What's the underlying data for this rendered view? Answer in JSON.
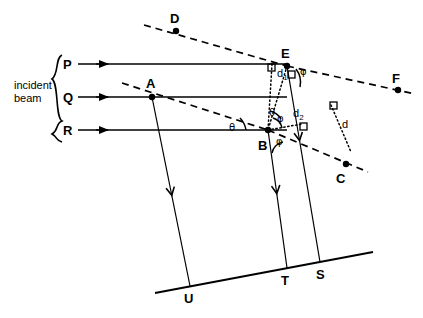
{
  "figure": {
    "background_color": "#ffffff",
    "stroke_color": "#000000",
    "width": 423,
    "height": 318
  },
  "annotations": {
    "incident_beam_line1": "incident",
    "incident_beam_line2": "beam",
    "brace_glyph": "}"
  },
  "points": [
    {
      "id": "P",
      "label": "P",
      "x": 72,
      "y": 64,
      "label_x": 63,
      "label_y": 69,
      "dot": false
    },
    {
      "id": "Q",
      "label": "Q",
      "x": 72,
      "y": 97,
      "label_x": 63,
      "label_y": 102,
      "dot": false
    },
    {
      "id": "R",
      "label": "R",
      "x": 72,
      "y": 130,
      "label_x": 63,
      "label_y": 135,
      "dot": false
    },
    {
      "id": "A",
      "label": "A",
      "x": 152,
      "y": 97,
      "label_x": 146,
      "label_y": 88,
      "dot": true
    },
    {
      "id": "B",
      "label": "B",
      "x": 268,
      "y": 130,
      "label_x": 258,
      "label_y": 150,
      "dot": true
    },
    {
      "id": "E",
      "label": "E",
      "x": 287,
      "y": 66,
      "label_x": 281,
      "label_y": 58,
      "dot": true
    },
    {
      "id": "D",
      "label": "D",
      "x": 176,
      "y": 31,
      "label_x": 170,
      "label_y": 23,
      "dot": true
    },
    {
      "id": "F",
      "label": "F",
      "x": 398,
      "y": 90,
      "label_x": 392,
      "label_y": 83,
      "dot": true
    },
    {
      "id": "C",
      "label": "C",
      "x": 346,
      "y": 164,
      "label_x": 336,
      "label_y": 183,
      "dot": true
    },
    {
      "id": "U",
      "label": "U",
      "x": 190,
      "y": 286,
      "label_x": 184,
      "label_y": 303,
      "dot": false
    },
    {
      "id": "T",
      "label": "T",
      "x": 287,
      "y": 268,
      "label_x": 281,
      "label_y": 285,
      "dot": false
    },
    {
      "id": "S",
      "label": "S",
      "x": 320,
      "y": 262,
      "label_x": 316,
      "label_y": 279,
      "dot": false
    }
  ],
  "distance_labels": [
    {
      "id": "d1",
      "base": "d",
      "sub": "1",
      "x": 277,
      "y": 77
    },
    {
      "id": "d2",
      "base": "d",
      "sub": "2",
      "x": 293,
      "y": 117
    },
    {
      "id": "d",
      "base": "d",
      "sub": "",
      "x": 342,
      "y": 128
    }
  ],
  "angle_labels": [
    {
      "id": "theta-A",
      "symbol": "θ",
      "x": 229,
      "y": 131
    },
    {
      "id": "theta-B",
      "symbol": "θ",
      "x": 269,
      "y": 116
    },
    {
      "id": "phi-E",
      "symbol": "φ",
      "x": 300,
      "y": 75
    },
    {
      "id": "phi-B1",
      "symbol": "φ",
      "x": 277,
      "y": 122
    },
    {
      "id": "phi-B2",
      "symbol": "φ",
      "x": 276,
      "y": 145
    }
  ],
  "rays": {
    "incident": [
      {
        "id": "P",
        "x1": 78,
        "x2": 287,
        "y": 64,
        "arrow_x": 108
      },
      {
        "id": "Q",
        "x1": 78,
        "x2": 287,
        "y": 97,
        "arrow_x": 108
      },
      {
        "id": "R",
        "x1": 78,
        "x2": 287,
        "y": 130,
        "arrow_x": 108
      }
    ]
  },
  "crystal_plane": {
    "x1": 155,
    "y1": 293,
    "x2": 373,
    "y2": 252
  },
  "diffracted_rays": [
    {
      "id": "D-to-E",
      "x1": 144,
      "y1": 25,
      "x2": 287,
      "y2": 66
    },
    {
      "id": "E-to-F",
      "x1": 287,
      "y1": 66,
      "x2": 415,
      "y2": 94
    },
    {
      "id": "A-to-C",
      "x1": 122,
      "y1": 83,
      "x2": 268,
      "y2": 130
    },
    {
      "id": "B-to-C",
      "x1": 268,
      "y1": 130,
      "x2": 368,
      "y2": 172
    }
  ],
  "scattered_lines": [
    {
      "id": "A-to-U",
      "x1": 152,
      "y1": 97,
      "x2": 190,
      "y2": 286,
      "arrow_t": 0.52
    },
    {
      "id": "B-to-T",
      "x1": 268,
      "y1": 130,
      "x2": 287,
      "y2": 268,
      "arrow_t": 0.46
    },
    {
      "id": "E-to-S",
      "x1": 287,
      "y1": 66,
      "x2": 320,
      "y2": 262,
      "arrow_t": 0.38
    }
  ],
  "dotted_constructions": [
    {
      "id": "d1-drop",
      "x1": 272,
      "y1": 64,
      "x2": 268,
      "y2": 130
    },
    {
      "id": "d1-slant",
      "x1": 287,
      "y1": 66,
      "x2": 268,
      "y2": 130
    },
    {
      "id": "d2-foot",
      "x1": 268,
      "y1": 130,
      "x2": 302,
      "y2": 124
    },
    {
      "id": "d-upper",
      "x1": 331,
      "y1": 105,
      "x2": 351,
      "y2": 152
    }
  ],
  "right_angle_marks": [
    {
      "id": "ra-E-left",
      "x": 268,
      "y": 64
    },
    {
      "id": "ra-E-below",
      "x": 288,
      "y": 71
    },
    {
      "id": "ra-d2",
      "x": 300,
      "y": 123
    },
    {
      "id": "ra-d-top",
      "x": 330,
      "y": 102
    }
  ]
}
